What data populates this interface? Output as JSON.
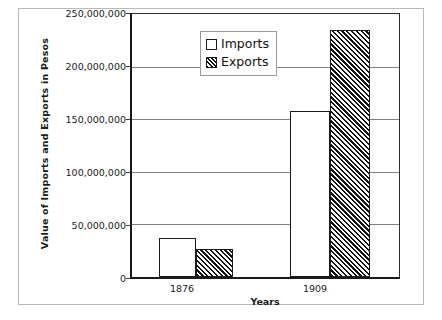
{
  "chart_data": {
    "type": "bar",
    "title": "",
    "xlabel": "Years",
    "ylabel": "Value of Imports and Exports in Pesos",
    "categories": [
      "1876",
      "1909"
    ],
    "series": [
      {
        "name": "Imports",
        "values": [
          37500000,
          157500000
        ]
      },
      {
        "name": "Exports",
        "values": [
          27000000,
          235000000
        ]
      }
    ],
    "ylim": [
      0,
      250000000
    ],
    "ytick_values": [
      0,
      50000000,
      100000000,
      150000000,
      200000000,
      250000000
    ],
    "ytick_labels": [
      "0",
      "50,000,000",
      "100,000,000",
      "150,000,000",
      "200,000,000",
      "250,000,000"
    ],
    "grid": true,
    "legend_position": "top-center",
    "colors": {
      "imports_fill": "#ffffff",
      "exports_fill": "#ffffff",
      "hatch": "#111111",
      "bar_border": "#1a1a1a",
      "gridline": "#808080",
      "axis": "#1a1a1a",
      "background": "#ffffff",
      "outer_frame": "#b9b9b9"
    }
  },
  "legend": {
    "items": [
      {
        "label": "Imports",
        "swatch": "open-square-swatch"
      },
      {
        "label": "Exports",
        "swatch": "hatched-square-swatch"
      }
    ]
  },
  "axes": {
    "y_title": "Value of Imports and Exports in Pesos",
    "x_title": "Years",
    "y_labels": [
      "250,000,000",
      "200,000,000",
      "150,000,000",
      "100,000,000",
      "50,000,000",
      "0"
    ],
    "x_labels": [
      "1876",
      "1909"
    ]
  }
}
